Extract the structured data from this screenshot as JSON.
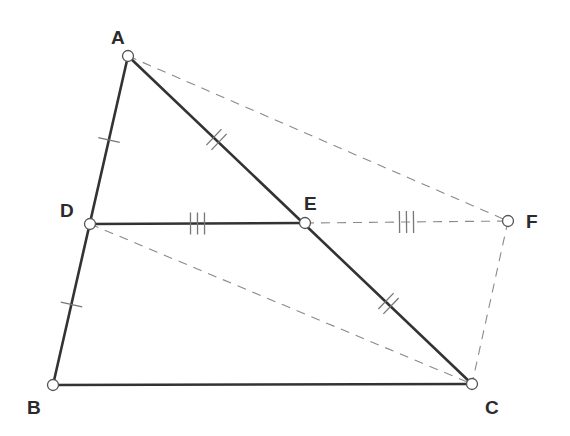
{
  "diagram": {
    "title": "",
    "points": [
      {
        "id": "A",
        "label": "A",
        "x": 128,
        "y": 56,
        "lx": 111,
        "ly": 44
      },
      {
        "id": "B",
        "label": "B",
        "x": 53,
        "y": 385,
        "lx": 27,
        "ly": 414
      },
      {
        "id": "C",
        "label": "C",
        "x": 472,
        "y": 384,
        "lx": 485,
        "ly": 414
      },
      {
        "id": "D",
        "label": "D",
        "x": 90,
        "y": 224,
        "lx": 60,
        "ly": 217
      },
      {
        "id": "E",
        "label": "E",
        "x": 305,
        "y": 223,
        "lx": 304,
        "ly": 210
      },
      {
        "id": "F",
        "label": "F",
        "x": 508,
        "y": 221,
        "lx": 526,
        "ly": 228
      }
    ],
    "segments": [
      {
        "from": "A",
        "to": "B",
        "style": "solid"
      },
      {
        "from": "A",
        "to": "C",
        "style": "solid"
      },
      {
        "from": "B",
        "to": "C",
        "style": "solid"
      },
      {
        "from": "D",
        "to": "E",
        "style": "solid"
      },
      {
        "from": "A",
        "to": "F",
        "style": "dashed"
      },
      {
        "from": "E",
        "to": "F",
        "style": "dashed"
      },
      {
        "from": "F",
        "to": "C",
        "style": "dashed"
      },
      {
        "from": "D",
        "to": "C",
        "style": "dashed"
      }
    ],
    "tick_marks": [
      {
        "segment": "A-D",
        "count": 1
      },
      {
        "segment": "D-B",
        "count": 1
      },
      {
        "segment": "A-E",
        "count": 2
      },
      {
        "segment": "E-C",
        "count": 2
      },
      {
        "segment": "D-E",
        "count": 3
      },
      {
        "segment": "E-F",
        "count": 3
      }
    ],
    "colors": {
      "solid_line": "#333333",
      "dashed_line": "#8a8a8a",
      "point_fill": "#ffffff",
      "label": "#2b2b2b"
    }
  }
}
